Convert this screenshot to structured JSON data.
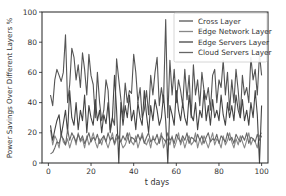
{
  "chart_data": {
    "type": "line",
    "title": "",
    "xlabel": "t days",
    "ylabel": "Power Savings Over Different Layers %",
    "xlim": [
      -3,
      103
    ],
    "ylim": [
      0,
      100
    ],
    "xticks": [
      0,
      20,
      40,
      60,
      80,
      100
    ],
    "yticks": [
      0,
      20,
      40,
      60,
      80,
      100
    ],
    "grid": false,
    "legend_position": "upper right",
    "x": [
      1,
      2,
      3,
      4,
      5,
      6,
      7,
      8,
      9,
      10,
      11,
      12,
      13,
      14,
      15,
      16,
      17,
      18,
      19,
      20,
      21,
      22,
      23,
      24,
      25,
      26,
      27,
      28,
      29,
      30,
      31,
      32,
      33,
      34,
      35,
      36,
      37,
      38,
      39,
      40,
      41,
      42,
      43,
      44,
      45,
      46,
      47,
      48,
      49,
      50,
      51,
      52,
      53,
      54,
      55,
      56,
      57,
      58,
      59,
      60,
      61,
      62,
      63,
      64,
      65,
      66,
      67,
      68,
      69,
      70,
      71,
      72,
      73,
      74,
      75,
      76,
      77,
      78,
      79,
      80,
      81,
      82,
      83,
      84,
      85,
      86,
      87,
      88,
      89,
      90,
      91,
      92,
      93,
      94,
      95,
      96,
      97,
      98,
      99,
      100
    ],
    "series": [
      {
        "name": "Cross Layer",
        "color": "#555555",
        "values": [
          45,
          38,
          55,
          62,
          58,
          54,
          60,
          85,
          40,
          52,
          76,
          70,
          55,
          65,
          50,
          73,
          62,
          45,
          72,
          58,
          52,
          30,
          60,
          40,
          28,
          35,
          55,
          48,
          20,
          30,
          25,
          69,
          55,
          42,
          30,
          53,
          40,
          48,
          46,
          72,
          60,
          40,
          50,
          30,
          35,
          48,
          32,
          58,
          45,
          60,
          70,
          38,
          50,
          40,
          95,
          30,
          68,
          45,
          62,
          40,
          55,
          48,
          38,
          62,
          42,
          58,
          30,
          65,
          45,
          55,
          38,
          60,
          48,
          42,
          50,
          35,
          58,
          62,
          40,
          55,
          50,
          68,
          45,
          60,
          35,
          55,
          40,
          62,
          48,
          30,
          58,
          45,
          50,
          40,
          70,
          55,
          62,
          45,
          72,
          58
        ]
      },
      {
        "name": "Edge Network Layer",
        "color": "#888888",
        "values": [
          22,
          12,
          18,
          15,
          10,
          20,
          14,
          12,
          16,
          10,
          15,
          18,
          12,
          20,
          14,
          16,
          10,
          18,
          12,
          15,
          20,
          14,
          10,
          16,
          12,
          18,
          14,
          10,
          15,
          20,
          12,
          16,
          18,
          14,
          10,
          12,
          16,
          20,
          14,
          12,
          18,
          10,
          15,
          20,
          14,
          12,
          16,
          10,
          18,
          14,
          12,
          15,
          20,
          10,
          14,
          16,
          12,
          18,
          10,
          14,
          20,
          12,
          16,
          10,
          15,
          18,
          12,
          14,
          20,
          10,
          16,
          12,
          18,
          14,
          10,
          15,
          20,
          12,
          16,
          14,
          10,
          18,
          12,
          15,
          20,
          14,
          10,
          16,
          12,
          18,
          14,
          10,
          15,
          20,
          12,
          16,
          14,
          10,
          18,
          20
        ]
      },
      {
        "name": "Edge Servers Layer",
        "color": "#444444",
        "values": [
          25,
          15,
          22,
          28,
          32,
          18,
          26,
          35,
          20,
          48,
          30,
          25,
          40,
          22,
          35,
          28,
          45,
          20,
          38,
          30,
          25,
          42,
          28,
          35,
          20,
          32,
          26,
          40,
          22,
          30,
          58,
          35,
          0,
          40,
          25,
          38,
          30,
          45,
          28,
          35,
          22,
          40,
          30,
          25,
          48,
          32,
          20,
          38,
          28,
          42,
          35,
          25,
          30,
          45,
          28,
          0,
          38,
          32,
          25,
          48,
          35,
          28,
          40,
          30,
          25,
          45,
          32,
          28,
          40,
          22,
          35,
          30,
          48,
          28,
          38,
          25,
          42,
          30,
          35,
          28,
          45,
          32,
          25,
          40,
          30,
          38,
          28,
          45,
          35,
          30,
          42,
          28,
          35,
          25,
          40,
          30,
          48,
          32,
          0,
          38
        ]
      },
      {
        "name": "Cloud Servers Layer",
        "color": "#666666",
        "values": [
          6,
          7,
          10,
          14,
          13,
          18,
          16,
          12,
          22,
          15,
          20,
          17,
          14,
          19,
          15,
          18,
          13,
          16,
          20,
          14,
          17,
          15,
          19,
          13,
          16,
          18,
          14,
          20,
          15,
          17,
          13,
          19,
          16,
          14,
          18,
          15,
          20,
          13,
          17,
          16,
          14,
          19,
          15,
          18,
          13,
          17,
          20,
          14,
          16,
          15,
          19,
          13,
          18,
          16,
          14,
          20,
          15,
          17,
          13,
          19,
          16,
          14,
          18,
          15,
          20,
          13,
          17,
          16,
          14,
          19,
          15,
          18,
          13,
          17,
          20,
          14,
          16,
          15,
          19,
          13,
          18,
          16,
          14,
          20,
          15,
          17,
          13,
          19,
          16,
          14,
          18,
          15,
          20,
          13,
          17,
          16,
          14,
          19,
          15,
          18
        ]
      }
    ]
  }
}
